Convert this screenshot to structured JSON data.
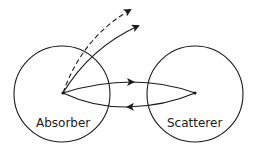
{
  "diagram": {
    "type": "scattering schematic",
    "nodes": [
      {
        "id": "absorber",
        "label": "Absorber",
        "shape": "circle",
        "center": [
          62,
          94
        ],
        "radius": 48
      },
      {
        "id": "scatterer",
        "label": "Scatterer",
        "shape": "circle",
        "center": [
          195,
          94
        ],
        "radius": 48
      }
    ],
    "edges": [
      {
        "from": "absorber",
        "to": "scatterer",
        "style": "solid",
        "direction": "forward",
        "path": "upper arc"
      },
      {
        "from": "scatterer",
        "to": "absorber",
        "style": "solid",
        "direction": "return",
        "path": "lower arc"
      },
      {
        "from": "absorber",
        "to": "outside",
        "style": "solid",
        "direction": "outgoing",
        "path": "upper right curve"
      },
      {
        "from": "absorber",
        "to": "outside",
        "style": "dashed",
        "direction": "outgoing",
        "path": "upper right curve"
      }
    ],
    "colors": {
      "line": "#1a1a1a",
      "background": "#ffffff"
    }
  }
}
